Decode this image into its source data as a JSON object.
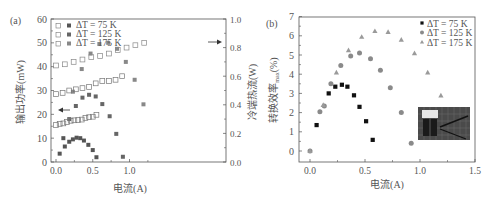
{
  "chart_data": [
    {
      "panel": "(a)",
      "type": "scatter",
      "xlabel": "电流(A)",
      "ylabel": "输出功率(mW)",
      "ylabel_right": "冷端热流(W)",
      "xlim": [
        -0.08,
        1.4
      ],
      "ylim": [
        0,
        60
      ],
      "ylim_right": [
        0,
        1.0
      ],
      "xticks": [
        "0.0",
        "0.5",
        "1.0"
      ],
      "yticks": [
        "0",
        "10",
        "20",
        "30",
        "40",
        "50",
        "60"
      ],
      "yticks_right": [
        "0.0",
        "0.2",
        "0.4",
        "0.6",
        "0.8",
        "1.0"
      ],
      "grid": false,
      "legend_position": "upper-left",
      "legend": [
        "ΔT = 75 K",
        "ΔT = 125 K",
        "ΔT = 175 K"
      ],
      "annotations": [
        "← (left-axis arrow, filled squares)",
        "→ (right-axis arrow, open squares)"
      ],
      "series": [
        {
          "name": "ΔT = 75 K",
          "quantity": "output power (mW)",
          "marker": "filled-square",
          "color": "#555555",
          "x": [
            0.05,
            0.1,
            0.12,
            0.18,
            0.23,
            0.28,
            0.33,
            0.38,
            0.44,
            0.5,
            0.55
          ],
          "y": [
            3.5,
            10,
            6.5,
            8.5,
            9.5,
            10.2,
            10,
            9,
            7.2,
            5,
            2
          ]
        },
        {
          "name": "ΔT = 125 K",
          "quantity": "output power (mW)",
          "marker": "filled-square",
          "color": "#666666",
          "x": [
            0.18,
            0.27,
            0.36,
            0.45,
            0.54,
            0.63,
            0.73,
            0.82,
            0.91
          ],
          "y": [
            18,
            23.5,
            27,
            28.2,
            27.5,
            24.3,
            19.2,
            11.8,
            2.2
          ]
        },
        {
          "name": "ΔT = 175 K",
          "quantity": "output power (mW)",
          "marker": "filled-square",
          "color": "#888888",
          "x": [
            0.23,
            0.35,
            0.47,
            0.59,
            0.71,
            0.83,
            0.95,
            1.07,
            1.19
          ],
          "y": [
            29.5,
            39,
            45.5,
            49.5,
            50,
            47.5,
            42,
            34.5,
            24.2
          ]
        },
        {
          "name": "ΔT = 75 K",
          "quantity": "cold-side heat flow (W)",
          "marker": "open-square",
          "color": "#777777",
          "x": [
            0.0,
            0.05,
            0.1,
            0.15,
            0.2,
            0.25,
            0.3,
            0.35,
            0.4,
            0.45,
            0.5,
            0.55
          ],
          "y_left_scale": [
            15.5,
            16,
            16.2,
            16.8,
            17.3,
            17.5,
            17.6,
            17.8,
            18.5,
            18.8,
            19.0,
            19.8
          ],
          "y": [
            0.26,
            0.27,
            0.27,
            0.28,
            0.29,
            0.29,
            0.29,
            0.3,
            0.31,
            0.31,
            0.32,
            0.33
          ]
        },
        {
          "name": "ΔT = 125 K",
          "quantity": "cold-side heat flow (W)",
          "marker": "open-square",
          "color": "#777777",
          "x": [
            0.0,
            0.09,
            0.18,
            0.27,
            0.36,
            0.45,
            0.54,
            0.63,
            0.72,
            0.81,
            0.9
          ],
          "y_left_scale": [
            28.5,
            29,
            30,
            30.5,
            31,
            31.5,
            33,
            34,
            34,
            34.5,
            36
          ],
          "y": [
            0.48,
            0.48,
            0.5,
            0.51,
            0.52,
            0.53,
            0.55,
            0.57,
            0.57,
            0.58,
            0.6
          ]
        },
        {
          "name": "ΔT = 175 K",
          "quantity": "cold-side heat flow (W)",
          "marker": "open-square",
          "color": "#888888",
          "x": [
            0.0,
            0.12,
            0.24,
            0.36,
            0.48,
            0.6,
            0.72,
            0.84,
            0.96,
            1.08,
            1.2
          ],
          "y_left_scale": [
            40.5,
            41,
            42,
            43,
            44,
            44.5,
            45.5,
            47,
            48,
            49,
            50
          ],
          "y": [
            0.68,
            0.68,
            0.7,
            0.72,
            0.73,
            0.74,
            0.76,
            0.78,
            0.8,
            0.82,
            0.83
          ]
        }
      ]
    },
    {
      "panel": "(b)",
      "type": "scatter",
      "xlabel": "电流(A)",
      "ylabel": "转换效率max(%)",
      "ylabel_main": "转换效率",
      "ylabel_sub": "max",
      "ylabel_unit": "(%)",
      "xlim": [
        -0.1,
        1.5
      ],
      "ylim": [
        -0.6,
        7
      ],
      "xticks": [
        "0.0",
        "0.5",
        "1.0",
        "1.5"
      ],
      "yticks": [
        "0",
        "1",
        "2",
        "3",
        "4",
        "5",
        "6",
        "7"
      ],
      "grid": false,
      "legend_position": "upper-right",
      "legend": [
        "ΔT = 75 K",
        "ΔT = 125 K",
        "ΔT = 175 K"
      ],
      "inset": "photo of thermoelectric device (lower-right)",
      "series": [
        {
          "name": "ΔT = 75 K",
          "marker": "filled-square",
          "color": "#111111",
          "x": [
            0.06,
            0.17,
            0.23,
            0.29,
            0.34,
            0.4,
            0.45,
            0.51,
            0.57
          ],
          "y": [
            1.35,
            3.0,
            3.35,
            3.45,
            3.35,
            2.9,
            2.3,
            1.55,
            0.58
          ]
        },
        {
          "name": "ΔT = 125 K",
          "marker": "circle",
          "color": "#8a8a8a",
          "x": [
            0.0,
            0.09,
            0.13,
            0.19,
            0.28,
            0.37,
            0.45,
            0.55,
            0.64,
            0.73,
            0.83,
            0.92
          ],
          "y": [
            0.0,
            2.05,
            2.35,
            3.5,
            4.45,
            4.95,
            5.1,
            4.8,
            4.2,
            3.3,
            2.0,
            0.4
          ]
        },
        {
          "name": "ΔT = 175 K",
          "marker": "triangle",
          "color": "#9a9a9a",
          "x": [
            0.0,
            0.12,
            0.24,
            0.35,
            0.47,
            0.59,
            0.71,
            0.83,
            0.95,
            1.07,
            1.19
          ],
          "y": [
            0.0,
            2.4,
            4.1,
            5.25,
            5.95,
            6.25,
            6.2,
            5.8,
            5.1,
            4.1,
            2.9
          ]
        }
      ]
    }
  ],
  "labels": {
    "panel_a": "(a)",
    "panel_b": "(b)",
    "legend_a": [
      "ΔT = 75 K",
      "ΔT = 125 K",
      "ΔT = 175 K"
    ],
    "legend_b": [
      "ΔT = 75 K",
      "ΔT = 125 K",
      "ΔT = 175 K"
    ]
  },
  "colors": {
    "axis": "#555555",
    "text": "#555555",
    "series_75": "#555555",
    "series_125": "#666666",
    "series_175": "#888888",
    "b_75": "#111111",
    "b_125": "#8a8a8a",
    "b_175": "#9a9a9a"
  }
}
